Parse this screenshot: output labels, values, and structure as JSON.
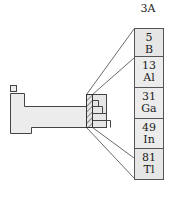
{
  "group": {
    "label": "3A",
    "elements": [
      {
        "number": "5",
        "symbol": "B"
      },
      {
        "number": "13",
        "symbol": "Al"
      },
      {
        "number": "31",
        "symbol": "Ga"
      },
      {
        "number": "49",
        "symbol": "In"
      },
      {
        "number": "81",
        "symbol": "Tl"
      }
    ]
  },
  "colors": {
    "cell_fill": "#e6e6e6",
    "outline": "#444444",
    "table_fill": "#ececec"
  }
}
